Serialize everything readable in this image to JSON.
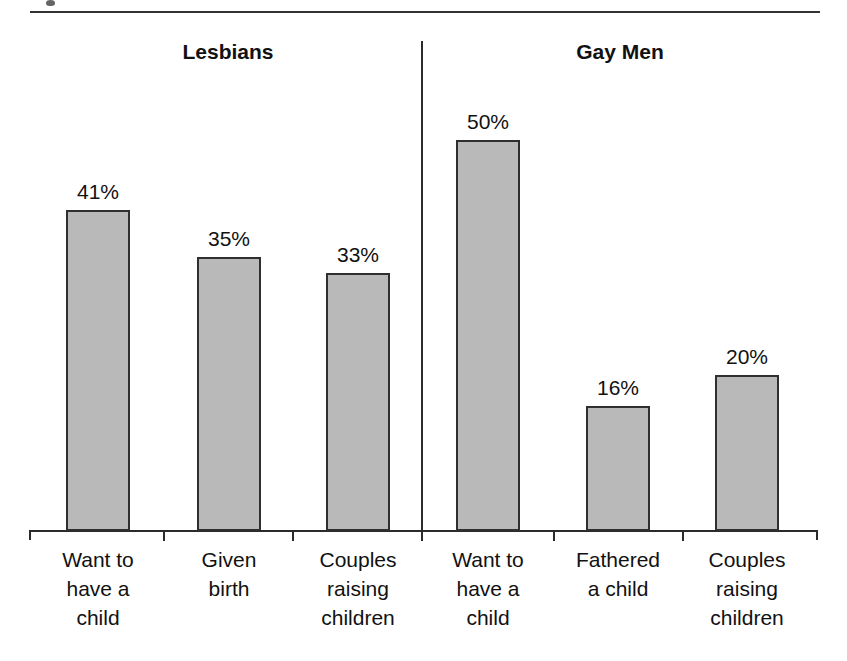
{
  "figure": {
    "top_rule": true,
    "divider": true
  },
  "chart_data": {
    "type": "bar",
    "title": "",
    "subtitle": "",
    "xlabel": "",
    "ylabel": "",
    "ylim": [
      0,
      58
    ],
    "grid": false,
    "legend": "none",
    "value_suffix": "%",
    "groups": [
      {
        "name": "Lesbians",
        "categories": [
          "Want to have a child",
          "Given birth",
          "Couples raising children"
        ],
        "category_lines": [
          [
            "Want to",
            "have a",
            "child"
          ],
          [
            "Given",
            "birth"
          ],
          [
            "Couples",
            "raising",
            "children"
          ]
        ],
        "values": [
          41,
          35,
          33
        ],
        "value_labels": [
          "41%",
          "35%",
          "33%"
        ]
      },
      {
        "name": "Gay Men",
        "categories": [
          "Want to have a child",
          "Fathered a child",
          "Couples raising children"
        ],
        "category_lines": [
          [
            "Want to",
            "have a",
            "child"
          ],
          [
            "Fathered",
            "a child"
          ],
          [
            "Couples",
            "raising",
            "children"
          ]
        ],
        "values": [
          50,
          16,
          20
        ],
        "value_labels": [
          "50%",
          "16%",
          "20%"
        ]
      }
    ],
    "colors": {
      "bar_fill": "#b9b9b9",
      "bar_border": "#2f2f2f",
      "axis": "#2b2b2b",
      "text": "#111111",
      "rule": "#333333"
    }
  }
}
